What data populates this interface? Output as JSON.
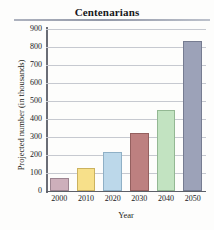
{
  "chart_data": {
    "type": "bar",
    "title": "Centenarians",
    "xlabel": "Year",
    "ylabel": "Projected number (in thousands)",
    "categories": [
      "2000",
      "2010",
      "2020",
      "2030",
      "2040",
      "2050"
    ],
    "values": [
      72,
      130,
      214,
      325,
      450,
      835
    ],
    "ylim": [
      0,
      900
    ],
    "ytick_labels": [
      "900",
      "800",
      "700",
      "600",
      "500",
      "400",
      "300",
      "200",
      "100",
      "0"
    ],
    "ytick_values": [
      900,
      800,
      700,
      600,
      500,
      400,
      300,
      200,
      100,
      0
    ],
    "grid": true,
    "legend": "none",
    "bar_colors": [
      "#cdafbb",
      "#f7e08a",
      "#bcd8ea",
      "#bd8080",
      "#c2e3c1",
      "#9ca2b8"
    ],
    "bar_border_colors": [
      "#9c8490",
      "#cbb25f",
      "#8fb0c6",
      "#94605f",
      "#93b893",
      "#767c91"
    ]
  }
}
